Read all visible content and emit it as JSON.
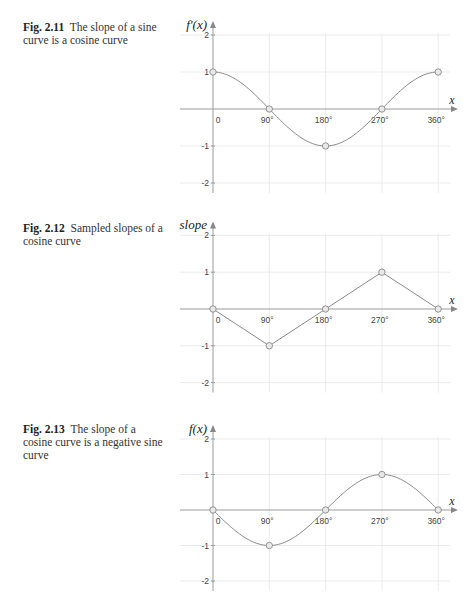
{
  "figures": [
    {
      "number": "Fig. 2.11",
      "caption": "The slope of a sine curve is a cosine curve",
      "top": 0
    },
    {
      "number": "Fig. 2.12",
      "caption": "Sampled slopes of a cosine curve",
      "top": 202
    },
    {
      "number": "Fig. 2.13",
      "caption": "The slope of a cosine curve is a negative sine curve",
      "top": 403
    }
  ],
  "chart_data": [
    {
      "type": "line",
      "title": "Fig. 2.11 The slope of a sine curve is a cosine curve",
      "xlabel": "x",
      "ylabel": "f'(x)",
      "x_ticks": [
        "0",
        "90°",
        "180°",
        "270°",
        "360°"
      ],
      "y_ticks": [
        "2",
        "1",
        "-1",
        "-2"
      ],
      "xlim": [
        0,
        360
      ],
      "ylim": [
        -2,
        2
      ],
      "grid": true,
      "curve": "cos",
      "markers": {
        "x": [
          0,
          90,
          180,
          270,
          360
        ],
        "y": [
          1,
          0,
          -1,
          0,
          1
        ]
      }
    },
    {
      "type": "line",
      "title": "Fig. 2.12 Sampled slopes of a cosine curve",
      "xlabel": "x",
      "ylabel": "slope",
      "x_ticks": [
        "0",
        "90°",
        "180°",
        "270°",
        "360°"
      ],
      "y_ticks": [
        "2",
        "1",
        "-1",
        "-2"
      ],
      "xlim": [
        0,
        360
      ],
      "ylim": [
        -2,
        2
      ],
      "grid": true,
      "curve": "polyline",
      "markers": {
        "x": [
          0,
          90,
          180,
          270,
          360
        ],
        "y": [
          0,
          -1,
          0,
          1,
          0
        ]
      }
    },
    {
      "type": "line",
      "title": "Fig. 2.13 The slope of a cosine curve is a negative sine curve",
      "xlabel": "x",
      "ylabel": "f(x)",
      "x_ticks": [
        "0",
        "90°",
        "180°",
        "270°",
        "360°"
      ],
      "y_ticks": [
        "2",
        "1",
        "-1",
        "-2"
      ],
      "xlim": [
        0,
        360
      ],
      "ylim": [
        -2,
        2
      ],
      "grid": true,
      "curve": "-sin",
      "markers": {
        "x": [
          0,
          90,
          180,
          270,
          360
        ],
        "y": [
          0,
          -1,
          0,
          1,
          0
        ]
      }
    }
  ]
}
